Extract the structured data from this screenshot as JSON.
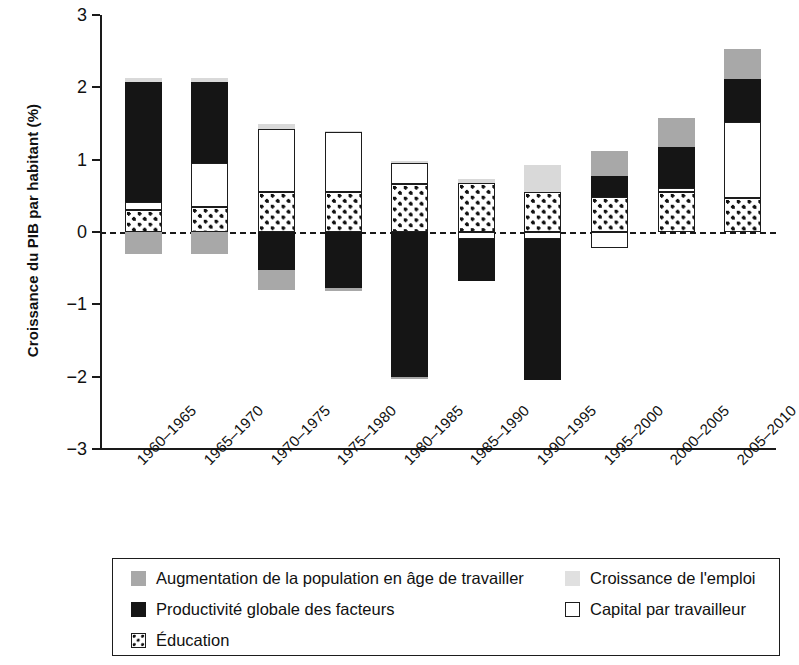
{
  "chart_data": {
    "type": "bar",
    "subtype": "stacked-bar-with-negative",
    "title": "",
    "xlabel": "",
    "ylabel": "Croissance du PIB par habitant (%)",
    "ylim": [
      -3,
      3
    ],
    "yticks": [
      "3",
      "2",
      "1",
      "0",
      "-1",
      "-2",
      "-3"
    ],
    "ytick_values": [
      3,
      2,
      1,
      0,
      -1,
      -2,
      -3
    ],
    "grid": false,
    "zero_line": true,
    "legend_position": "bottom",
    "categories": [
      "1960-1965",
      "1965-1970",
      "1970-1975",
      "1975-1980",
      "1980-1985",
      "1985-1990",
      "1990-1995",
      "1995-2000",
      "2000-2005",
      "2005-2010"
    ],
    "series": [
      {
        "name": "Augmentation de la population en âge de travailler",
        "color": "#a8a8a8",
        "values": [
          -0.3,
          -0.3,
          -0.28,
          0.0,
          0.0,
          0.0,
          0.0,
          0.35,
          0.4,
          0.42
        ]
      },
      {
        "name": "Croissance de l'emploi",
        "color": "#d9d9d9",
        "values": [
          0.06,
          0.06,
          0.06,
          0.02,
          0.02,
          0.05,
          0.37,
          0.0,
          0.0,
          0.0
        ]
      },
      {
        "name": "Productivité globale des facteurs",
        "color": "#151515",
        "values": [
          1.65,
          1.12,
          -0.52,
          -0.78,
          -2.0,
          -0.6,
          -1.95,
          0.29,
          0.6,
          0.59
        ]
      },
      {
        "name": "Capital par travailleur",
        "color": "#ffffff",
        "values": [
          0.12,
          0.6,
          0.88,
          0.83,
          0.3,
          -0.1,
          -0.1,
          -0.22,
          0.06,
          1.05
        ]
      },
      {
        "name": "Éducation",
        "color": "pattern-dots",
        "values": [
          0.3,
          0.35,
          0.55,
          0.55,
          0.66,
          0.68,
          0.55,
          0.48,
          0.55,
          0.47
        ]
      }
    ],
    "bar_segments": [
      {
        "category": "1960-1965",
        "segments": [
          {
            "series": "Éducation",
            "from": 0.0,
            "to": 0.3
          },
          {
            "series": "Capital par travailleur",
            "from": 0.3,
            "to": 0.42
          },
          {
            "series": "Productivité globale des facteurs",
            "from": 0.42,
            "to": 2.07
          },
          {
            "series": "Croissance de l'emploi",
            "from": 2.07,
            "to": 2.13
          },
          {
            "series": "Augmentation de la population en âge de travailler",
            "from": 0.0,
            "to": -0.3
          }
        ]
      },
      {
        "category": "1965-1970",
        "segments": [
          {
            "series": "Éducation",
            "from": 0.0,
            "to": 0.35
          },
          {
            "series": "Capital par travailleur",
            "from": 0.35,
            "to": 0.95
          },
          {
            "series": "Productivité globale des facteurs",
            "from": 0.95,
            "to": 2.07
          },
          {
            "series": "Croissance de l'emploi",
            "from": 2.07,
            "to": 2.13
          },
          {
            "series": "Augmentation de la population en âge de travailler",
            "from": 0.0,
            "to": -0.3
          }
        ]
      },
      {
        "category": "1970-1975",
        "segments": [
          {
            "series": "Éducation",
            "from": 0.0,
            "to": 0.55
          },
          {
            "series": "Capital par travailleur",
            "from": 0.55,
            "to": 1.43
          },
          {
            "series": "Croissance de l'emploi",
            "from": 1.43,
            "to": 1.49
          },
          {
            "series": "Productivité globale des facteurs",
            "from": 0.0,
            "to": -0.52
          },
          {
            "series": "Augmentation de la population en âge de travailler",
            "from": -0.52,
            "to": -0.8
          }
        ]
      },
      {
        "category": "1975-1980",
        "segments": [
          {
            "series": "Éducation",
            "from": 0.0,
            "to": 0.55
          },
          {
            "series": "Capital par travailleur",
            "from": 0.55,
            "to": 1.38
          },
          {
            "series": "Croissance de l'emploi",
            "from": 1.38,
            "to": 1.4
          },
          {
            "series": "Productivité globale des facteurs",
            "from": 0.0,
            "to": -0.78
          },
          {
            "series": "Augmentation de la population en âge de travailler",
            "from": -0.78,
            "to": -0.82
          }
        ]
      },
      {
        "category": "1980-1985",
        "segments": [
          {
            "series": "Éducation",
            "from": 0.0,
            "to": 0.66
          },
          {
            "series": "Capital par travailleur",
            "from": 0.66,
            "to": 0.96
          },
          {
            "series": "Croissance de l'emploi",
            "from": 0.96,
            "to": 0.98
          },
          {
            "series": "Productivité globale des facteurs",
            "from": 0.0,
            "to": -2.0
          },
          {
            "series": "Augmentation de la population en âge de travailler",
            "from": -2.0,
            "to": -2.03
          }
        ]
      },
      {
        "category": "1985-1990",
        "segments": [
          {
            "series": "Éducation",
            "from": 0.0,
            "to": 0.68
          },
          {
            "series": "Croissance de l'emploi",
            "from": 0.68,
            "to": 0.73
          },
          {
            "series": "Capital par travailleur",
            "from": 0.0,
            "to": -0.1
          },
          {
            "series": "Productivité globale des facteurs",
            "from": -0.1,
            "to": -0.68
          }
        ]
      },
      {
        "category": "1990-1995",
        "segments": [
          {
            "series": "Éducation",
            "from": 0.0,
            "to": 0.55
          },
          {
            "series": "Croissance de l'emploi",
            "from": 0.55,
            "to": 0.92
          },
          {
            "series": "Capital par travailleur",
            "from": 0.0,
            "to": -0.1
          },
          {
            "series": "Productivité globale des facteurs",
            "from": -0.1,
            "to": -2.05
          }
        ]
      },
      {
        "category": "1995-2000",
        "segments": [
          {
            "series": "Éducation",
            "from": 0.0,
            "to": 0.48
          },
          {
            "series": "Productivité globale des facteurs",
            "from": 0.48,
            "to": 0.77
          },
          {
            "series": "Augmentation de la population en âge de travailler",
            "from": 0.77,
            "to": 1.12
          },
          {
            "series": "Capital par travailleur",
            "from": 0.0,
            "to": -0.22
          }
        ]
      },
      {
        "category": "2000-2005",
        "segments": [
          {
            "series": "Éducation",
            "from": 0.0,
            "to": 0.55
          },
          {
            "series": "Capital par travailleur",
            "from": 0.55,
            "to": 0.61
          },
          {
            "series": "Productivité globale des facteurs",
            "from": 0.61,
            "to": 1.17
          },
          {
            "series": "Augmentation de la population en âge de travailler",
            "from": 1.17,
            "to": 1.57
          }
        ]
      },
      {
        "category": "2005-2010",
        "segments": [
          {
            "series": "Éducation",
            "from": 0.0,
            "to": 0.47
          },
          {
            "series": "Capital par travailleur",
            "from": 0.47,
            "to": 1.52
          },
          {
            "series": "Productivité globale des facteurs",
            "from": 1.52,
            "to": 2.11
          },
          {
            "series": "Augmentation de la population en âge de travailler",
            "from": 2.11,
            "to": 2.53
          }
        ]
      }
    ],
    "legend": [
      {
        "label": "Augmentation de la population en âge de travailler",
        "swatch": "pop"
      },
      {
        "label": "Croissance de l'emploi",
        "swatch": "emploi"
      },
      {
        "label": "Productivité globale des facteurs",
        "swatch": "tfp"
      },
      {
        "label": "Capital par travailleur",
        "swatch": "capital"
      },
      {
        "label": "Éducation",
        "swatch": "educ"
      }
    ]
  }
}
